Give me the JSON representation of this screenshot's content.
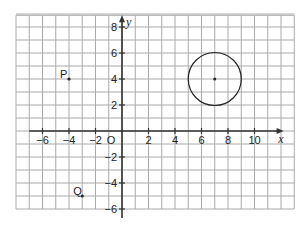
{
  "diagram": {
    "type": "coordinate-grid",
    "x_axis": {
      "label": "x",
      "min": -8,
      "max": 13,
      "ticks": [
        -6,
        -4,
        -2,
        2,
        4,
        6,
        8,
        10
      ],
      "tick_labels": [
        "−6",
        "−4",
        "−2",
        "2",
        "4",
        "6",
        "8",
        "10"
      ]
    },
    "y_axis": {
      "label": "y",
      "min": -6,
      "max": 9,
      "ticks": [
        8,
        6,
        4,
        2,
        -2,
        -4,
        -6
      ],
      "tick_labels": [
        "8",
        "6",
        "4",
        "2",
        "−2",
        "−4",
        "−6"
      ]
    },
    "origin_label": "O",
    "points": [
      {
        "label": "P",
        "x": -4,
        "y": 4
      },
      {
        "label": "Q",
        "x": -3,
        "y": -5
      }
    ],
    "circle": {
      "center": [
        7,
        4
      ],
      "radius": 2
    },
    "colors": {
      "grid": "#aaaaaa",
      "axis": "#333333",
      "ink": "#222222"
    }
  }
}
